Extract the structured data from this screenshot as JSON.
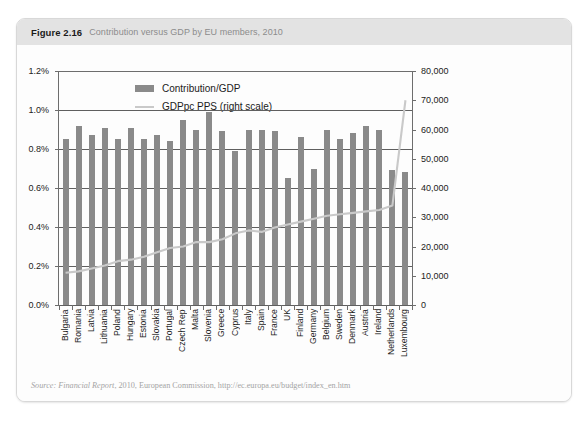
{
  "figure": {
    "number": "Figure 2.16",
    "title": "Contribution versus GDP by EU members, 2010",
    "source": "Source: Financial Report, 2010, European Commission, http://ec.europa.eu/budget/index_en.htm",
    "source_italic_prefix": "Source: Financial Report",
    "source_rest": ", 2010, European Commission, http://ec.europa.eu/budget/index_en.htm"
  },
  "colors": {
    "bar": "#8a8a8a",
    "line": "#c9c9c9",
    "axis": "#6d6d6d",
    "grid": "#5f5f5f",
    "header_band": "#e3e3e3",
    "card_bg": "#fdfdfd"
  },
  "chart_data": {
    "type": "bar",
    "title": "Contribution versus GDP by EU members, 2010",
    "xlabel": "",
    "ylabel": "",
    "y2label": "",
    "grid": true,
    "legend_position": "top-left-inside",
    "categories": [
      "Bulgaria",
      "Romania",
      "Latvia",
      "Lithuania",
      "Poland",
      "Hungary",
      "Estonia",
      "Slovakia",
      "Portugal",
      "Czech Rep",
      "Malta",
      "Slovenia",
      "Greece",
      "Cyprus",
      "Italy",
      "Spain",
      "France",
      "UK",
      "Finland",
      "Germany",
      "Belgium",
      "Sweden",
      "Denmark",
      "Austria",
      "Ireland",
      "Netherlands",
      "Luxembourg"
    ],
    "series": [
      {
        "name": "Contribution/GDP",
        "type": "bar",
        "axis": "left",
        "unit": "%",
        "values": [
          0.85,
          0.92,
          0.87,
          0.91,
          0.85,
          0.91,
          0.85,
          0.87,
          0.84,
          0.95,
          0.9,
          0.99,
          0.89,
          0.79,
          0.9,
          0.9,
          0.89,
          0.65,
          0.86,
          0.7,
          0.9,
          0.85,
          0.88,
          0.92,
          0.9,
          0.69,
          0.68
        ]
      },
      {
        "name": "GDPpc PPS (right scale)",
        "type": "line",
        "axis": "right",
        "unit": "PPS",
        "values": [
          11000,
          11500,
          12500,
          13500,
          15000,
          15500,
          16500,
          18000,
          19500,
          20000,
          21500,
          21500,
          22500,
          24500,
          25500,
          25000,
          26500,
          27500,
          28500,
          29500,
          30500,
          31000,
          31500,
          32000,
          32500,
          34000,
          70000
        ]
      }
    ],
    "yaxis_left": {
      "ticks": [
        "0.0%",
        "0.2%",
        "0.4%",
        "0.6%",
        "0.8%",
        "1.0%",
        "1.2%"
      ],
      "values": [
        0,
        0.2,
        0.4,
        0.6,
        0.8,
        1.0,
        1.2
      ],
      "min": 0,
      "max": 1.2
    },
    "yaxis_right": {
      "ticks": [
        "0",
        "10,000",
        "20,000",
        "30,000",
        "40,000",
        "50,000",
        "60,000",
        "70,000",
        "80,000"
      ],
      "values": [
        0,
        10000,
        20000,
        30000,
        40000,
        50000,
        60000,
        70000,
        80000
      ],
      "min": 0,
      "max": 80000
    }
  },
  "legend": {
    "items": [
      {
        "label": "Contribution/GDP",
        "marker": "bar-swatch"
      },
      {
        "label": "GDPpc PPS (right scale)",
        "marker": "line-swatch"
      }
    ]
  }
}
